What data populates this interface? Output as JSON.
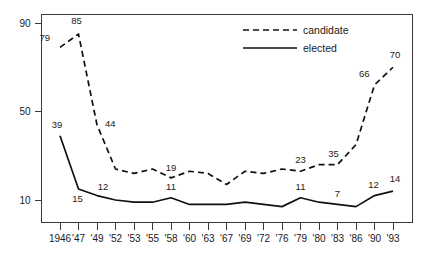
{
  "chart_data": {
    "type": "line",
    "title": "",
    "subtitle": "",
    "xlabel": "",
    "ylabel": "",
    "x": [
      "1946",
      "'47",
      "'49",
      "'52",
      "'53",
      "'55",
      "'58",
      "'60",
      "'63",
      "'67",
      "'69",
      "'72",
      "'76",
      "'79",
      "'80",
      "'83",
      "'86",
      "'90",
      "'93"
    ],
    "categories": [
      "1946",
      "'47",
      "'49",
      "'52",
      "'53",
      "'55",
      "'58",
      "'60",
      "'63",
      "'67",
      "'69",
      "'72",
      "'76",
      "'79",
      "'80",
      "'83",
      "'86",
      "'90",
      "'93"
    ],
    "ylim": [
      3,
      93
    ],
    "yticks": [
      10,
      50,
      90
    ],
    "ytick_labels": [
      "10",
      "50",
      "90"
    ],
    "grid": false,
    "legend_position": "top-right",
    "series": [
      {
        "name": "candidate",
        "style": "dashed",
        "values": [
          79,
          85,
          44,
          24,
          22,
          24,
          20,
          23,
          22,
          17,
          23,
          22,
          24,
          23,
          26,
          26,
          35,
          62,
          70
        ],
        "labels": [
          {
            "index": 0,
            "text": "79"
          },
          {
            "index": 1,
            "text": "85"
          },
          {
            "index": 2,
            "text": "44"
          },
          {
            "index": 6,
            "text": "19"
          },
          {
            "index": 13,
            "text": "23"
          },
          {
            "index": 15,
            "text": "35"
          },
          {
            "index": 17,
            "text": "66"
          },
          {
            "index": 18,
            "text": "70"
          }
        ]
      },
      {
        "name": "elected",
        "style": "solid",
        "values": [
          39,
          15,
          12,
          10,
          9,
          9,
          11,
          8,
          8,
          8,
          9,
          8,
          7,
          11,
          9,
          8,
          7,
          12,
          14
        ],
        "labels": [
          {
            "index": 0,
            "text": "39"
          },
          {
            "index": 1,
            "text": "15"
          },
          {
            "index": 2,
            "text": "12"
          },
          {
            "index": 6,
            "text": "11"
          },
          {
            "index": 13,
            "text": "11"
          },
          {
            "index": 15,
            "text": "7"
          },
          {
            "index": 17,
            "text": "12"
          },
          {
            "index": 18,
            "text": "14"
          }
        ]
      }
    ],
    "legend": [
      {
        "label": "candidate",
        "style": "dashed"
      },
      {
        "label": "elected",
        "style": "solid"
      }
    ],
    "colors": {
      "line": "#111111",
      "axis": "#3a3a3a",
      "text": "#1a1a1a",
      "background": "#ffffff"
    }
  },
  "axis": {
    "y_tick_90": "90",
    "y_tick_50": "50",
    "y_tick_10": "10",
    "x_ticks": [
      "1946",
      "'47",
      "'49",
      "'52",
      "'53",
      "'55",
      "'58",
      "'60",
      "'63",
      "'67",
      "'69",
      "'72",
      "'76",
      "'79",
      "'80",
      "'83",
      "'86",
      "'90",
      "'93"
    ]
  },
  "legend": {
    "candidate_label": "candidate",
    "elected_label": "elected"
  },
  "annotations": {
    "candidate": [
      "79",
      "85",
      "44",
      "19",
      "23",
      "35",
      "66",
      "70"
    ],
    "elected": [
      "39",
      "15",
      "12",
      "11",
      "11",
      "7",
      "12",
      "14"
    ]
  }
}
